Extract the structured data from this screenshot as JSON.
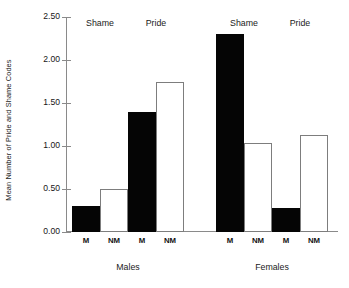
{
  "chart_data": {
    "type": "bar",
    "title": "",
    "xlabel": "",
    "ylabel": "Mean Number of Pride and Shame Codes",
    "ylim": [
      0.0,
      2.5
    ],
    "ytick_labels": [
      "0.00",
      "0.50",
      "1.00",
      "1.50",
      "2.00",
      "2.50"
    ],
    "ytick_values": [
      0.0,
      0.5,
      1.0,
      1.5,
      2.0,
      2.5
    ],
    "grid": false,
    "legend": null,
    "categories": [
      "M",
      "NM",
      "M",
      "NM",
      "M",
      "NM",
      "M",
      "NM"
    ],
    "values": [
      0.3,
      0.5,
      1.4,
      1.75,
      2.3,
      1.03,
      0.28,
      1.13
    ],
    "bar_styles": [
      "filled",
      "open",
      "filled",
      "open",
      "filled",
      "open",
      "filled",
      "open"
    ],
    "bars": [
      {
        "group": "Males",
        "condition": "Shame",
        "category": "M",
        "value": 0.3,
        "style": "filled"
      },
      {
        "group": "Males",
        "condition": "Shame",
        "category": "NM",
        "value": 0.5,
        "style": "open"
      },
      {
        "group": "Males",
        "condition": "Pride",
        "category": "M",
        "value": 1.4,
        "style": "filled"
      },
      {
        "group": "Males",
        "condition": "Pride",
        "category": "NM",
        "value": 1.75,
        "style": "open"
      },
      {
        "group": "Females",
        "condition": "Shame",
        "category": "M",
        "value": 2.3,
        "style": "filled"
      },
      {
        "group": "Females",
        "condition": "Shame",
        "category": "NM",
        "value": 1.03,
        "style": "open"
      },
      {
        "group": "Females",
        "condition": "Pride",
        "category": "M",
        "value": 0.28,
        "style": "filled"
      },
      {
        "group": "Females",
        "condition": "Pride",
        "category": "NM",
        "value": 1.13,
        "style": "open"
      }
    ],
    "condition_headers": [
      "Shame",
      "Pride",
      "Shame",
      "Pride"
    ],
    "group_labels": [
      "Males",
      "Females"
    ],
    "colors": {
      "filled_bar": "#050505",
      "open_bar_fill": "#ffffff",
      "open_bar_edge": "#7d7d7d",
      "axis": "#8a8a8a",
      "text": "#1a1a1a",
      "background": "#ffffff"
    }
  }
}
